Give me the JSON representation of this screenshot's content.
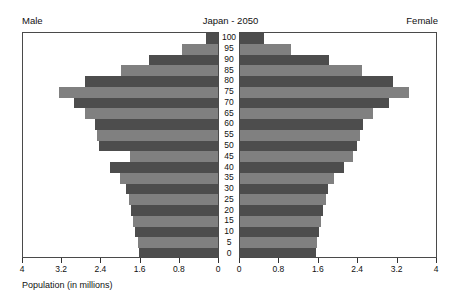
{
  "header": {
    "title": "Japan - 2050",
    "male_label": "Male",
    "female_label": "Female"
  },
  "axis": {
    "caption": "Population (in millions)",
    "male_ticks": [
      "4",
      "3.2",
      "2.4",
      "1.6",
      "0.8",
      "0"
    ],
    "female_ticks": [
      "0",
      "0.8",
      "1.6",
      "2.4",
      "3.2",
      "4"
    ],
    "max": 4,
    "tick_step": 0.8
  },
  "colors": {
    "bar_light": "#808080",
    "bar_dark": "#4d4d4d",
    "frame": "#4a4a4a",
    "text": "#111111",
    "background": "#ffffff"
  },
  "chart_data": {
    "type": "bar",
    "subtype": "population-pyramid",
    "title": "Japan - 2050",
    "xlabel": "Population (in millions)",
    "ylabel": "",
    "xlim": [
      0,
      4
    ],
    "grid": false,
    "legend": "none",
    "categories": [
      "0",
      "5",
      "10",
      "15",
      "20",
      "25",
      "30",
      "35",
      "40",
      "45",
      "50",
      "55",
      "60",
      "65",
      "70",
      "75",
      "80",
      "85",
      "90",
      "95",
      "100"
    ],
    "series": [
      {
        "name": "Male",
        "side": "left",
        "values": [
          1.62,
          1.65,
          1.7,
          1.74,
          1.78,
          1.83,
          1.88,
          2.02,
          2.22,
          1.8,
          2.44,
          2.48,
          2.53,
          2.72,
          2.96,
          3.27,
          2.72,
          2.0,
          1.42,
          0.74,
          0.24
        ]
      },
      {
        "name": "Female",
        "side": "right",
        "values": [
          1.55,
          1.57,
          1.62,
          1.66,
          1.7,
          1.75,
          1.8,
          1.92,
          2.12,
          2.3,
          2.38,
          2.44,
          2.5,
          2.72,
          3.04,
          3.44,
          3.12,
          2.48,
          1.82,
          1.04,
          0.48
        ]
      }
    ]
  }
}
